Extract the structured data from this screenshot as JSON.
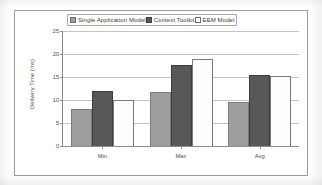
{
  "chart_data": {
    "type": "bar",
    "title": "",
    "subtitle": "",
    "xlabel": "",
    "ylabel": "Delivery Time (ms)",
    "categories": [
      "Min",
      "Max",
      "Avg"
    ],
    "series": [
      {
        "name": "Single Application Model",
        "color": "#9e9e9e",
        "values": [
          8,
          11.8,
          9.5
        ]
      },
      {
        "name": "Context Toolkit",
        "color": "#585858",
        "values": [
          12,
          17.7,
          15.5
        ]
      },
      {
        "name": "EEM Model",
        "color": "#fdfdfd",
        "values": [
          10,
          19,
          15.2
        ]
      }
    ],
    "ylim": [
      0,
      25
    ],
    "ytick_values": [
      0,
      5,
      10,
      15,
      20,
      25
    ],
    "ytick_labels": [
      "0",
      "5",
      "10",
      "15",
      "20",
      "25"
    ],
    "grid": true,
    "legend_position": "top-inside",
    "orientation": "vertical",
    "grouping": "clustered"
  },
  "legend": {
    "items": [
      {
        "label": "Single Application Model",
        "swatch": "#9e9e9e"
      },
      {
        "label": "Context Toolkit",
        "swatch": "#585858"
      },
      {
        "label": "EEM Model",
        "swatch": "#ffffff"
      }
    ]
  },
  "axes": {
    "y_title": "Delivery Time (ms)",
    "y_ticks": [
      "25",
      "20",
      "15",
      "10",
      "5",
      "0"
    ],
    "x_ticks": [
      "Min",
      "Max",
      "Avg"
    ]
  },
  "colors": {
    "series_1": "#9e9e9e",
    "series_2": "#585858",
    "series_3": "#ffffff",
    "grid": "#c4c4c4",
    "axis": "#8d8d8d",
    "frame": "#9a9a9a",
    "text": "#4a4a4a"
  }
}
